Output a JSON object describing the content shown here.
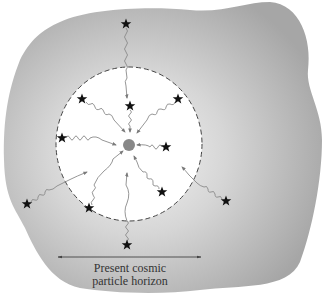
{
  "caption": {
    "line1": "Present cosmic",
    "line2": "particle horizon"
  },
  "colors": {
    "universe_fill_inner": "#f2f2f2",
    "universe_fill_outer": "#a9a9a9",
    "horizon_interior": "#ffffff",
    "horizon_border": "#444444",
    "photon_path": "#8a8a8a",
    "star": "#111111",
    "observer": "#888888",
    "scale_arrow": "#444444"
  },
  "horizon": {
    "cx": 129,
    "cy": 144,
    "rx": 73,
    "ry": 77
  },
  "observer": {
    "x": 129,
    "y": 145,
    "r": 6
  },
  "stars": [
    {
      "id": "top-outer",
      "x": 126,
      "y": 24,
      "inside": false
    },
    {
      "id": "top-inner",
      "x": 130,
      "y": 106,
      "inside": true
    },
    {
      "id": "upper-left",
      "x": 82,
      "y": 99,
      "inside": true
    },
    {
      "id": "upper-right",
      "x": 178,
      "y": 99,
      "inside": true
    },
    {
      "id": "left",
      "x": 62,
      "y": 138,
      "inside": true
    },
    {
      "id": "right-inner",
      "x": 166,
      "y": 147,
      "inside": true
    },
    {
      "id": "lower-right-inner",
      "x": 162,
      "y": 192,
      "inside": true
    },
    {
      "id": "lower-left-inner",
      "x": 89,
      "y": 208,
      "inside": true
    },
    {
      "id": "left-outer",
      "x": 27,
      "y": 204,
      "inside": false
    },
    {
      "id": "right-outer",
      "x": 226,
      "y": 201,
      "inside": false
    },
    {
      "id": "bottom-outer",
      "x": 127,
      "y": 245,
      "inside": false
    }
  ],
  "scale_bar": {
    "x1": 57,
    "x2": 202,
    "y": 257,
    "label_ref": "caption"
  }
}
